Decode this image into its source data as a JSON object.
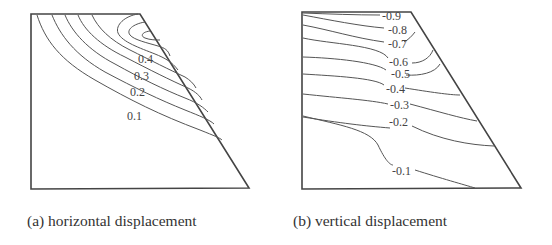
{
  "figure": {
    "panels": [
      {
        "id": "a",
        "caption": "(a) horizontal displacement",
        "contour_labels": [
          "0.4",
          "0.3",
          "0.2",
          "0.1"
        ]
      },
      {
        "id": "b",
        "caption": "(b) vertical displacement",
        "contour_labels": [
          "-0.9",
          "-0.8",
          "-0.7",
          "-0.6",
          "-0.5",
          "-0.4",
          "-0.3",
          "-0.2",
          "-0.1"
        ]
      }
    ]
  }
}
